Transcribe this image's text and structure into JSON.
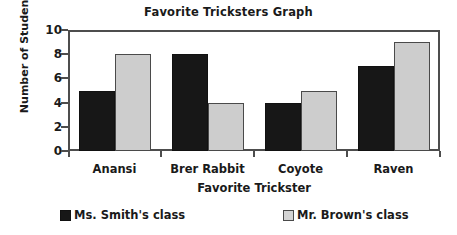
{
  "chart_data": {
    "type": "bar",
    "title": "Favorite Tricksters Graph",
    "xlabel": "Favorite Trickster",
    "ylabel": "Number of Students",
    "categories": [
      "Anansi",
      "Brer Rabbit",
      "Coyote",
      "Raven"
    ],
    "series": [
      {
        "name": "Ms. Smith's class",
        "color": "#171717",
        "values": [
          5,
          8,
          4,
          7
        ]
      },
      {
        "name": "Mr. Brown's class",
        "color": "#cdcdcd",
        "values": [
          8,
          4,
          5,
          9
        ]
      }
    ],
    "ylim": [
      0,
      10
    ],
    "yticks": [
      0,
      2,
      4,
      6,
      8,
      10
    ],
    "ytick_labels": [
      "0",
      "2",
      "4",
      "6",
      "8",
      "10"
    ],
    "grid": false,
    "legend_position": "bottom",
    "frame_color": "#4d4d4d"
  }
}
